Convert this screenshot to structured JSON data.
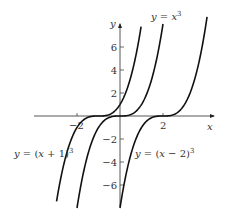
{
  "chart_data": {
    "type": "line",
    "title": "",
    "xlabel": "x",
    "ylabel": "y",
    "xlim": [
      -5,
      5
    ],
    "ylim": [
      -8,
      8
    ],
    "x_ticks": [
      -2,
      2
    ],
    "x_tick_labels": [
      "−2",
      "2"
    ],
    "y_ticks": [
      -6,
      -4,
      -2,
      2,
      4,
      6
    ],
    "y_tick_labels": [
      "−6",
      "−4",
      "−2",
      "2",
      "4",
      "6"
    ],
    "grid": false,
    "legend": null,
    "series": [
      {
        "name": "y = (x + 1)^3",
        "label": "y = (x + 1)",
        "exponent": "3",
        "shift": -1,
        "x_range": [
          -2.95,
          0.98
        ]
      },
      {
        "name": "y = x^3",
        "label": "y = x",
        "exponent": "3",
        "shift": 0,
        "x_range": [
          -2.0,
          2.0
        ]
      },
      {
        "name": "y = (x − 2)^3",
        "label": "y = (x − 2)",
        "exponent": "3",
        "shift": 2,
        "x_range": [
          0.0,
          4.05
        ]
      }
    ],
    "annotations": [
      {
        "text": "y = x^3",
        "near": "top of y = x^3 curve"
      },
      {
        "text": "y = (x + 1)^3",
        "near": "left, below x-axis"
      },
      {
        "text": "y = (x − 2)^3",
        "near": "right of y-axis, below x-axis"
      }
    ]
  }
}
